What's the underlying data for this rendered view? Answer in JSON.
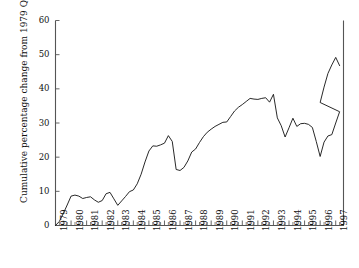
{
  "chart_data": {
    "type": "line",
    "title": "",
    "subtitle": "",
    "xlabel": "",
    "ylabel": "Cumulative percentage change from 1979 Q1",
    "ylim": [
      0,
      60
    ],
    "yticks": [
      0,
      10,
      20,
      30,
      40,
      50,
      60
    ],
    "ytick_labels": [
      "0",
      "10",
      "20",
      "30",
      "40",
      "50",
      "60"
    ],
    "xlim": [
      1979.0,
      1997.5
    ],
    "xticks": [
      1979,
      1980,
      1981,
      1982,
      1983,
      1984,
      1985,
      1986,
      1987,
      1988,
      1989,
      1990,
      1991,
      1992,
      1993,
      1994,
      1995,
      1996,
      1997
    ],
    "xtick_labels": [
      "1979",
      "1980",
      "1981",
      "1982",
      "1983",
      "1984",
      "1985",
      "1986",
      "1987",
      "1988",
      "1989",
      "1990",
      "1991",
      "1992",
      "1993",
      "1994",
      "1995",
      "1996",
      "1997"
    ],
    "minor_ticks": "quarterly",
    "grid": false,
    "legend": "none",
    "line_color": "#111111",
    "axis_color": "#555555",
    "frequency": "quarterly",
    "series": [
      {
        "name": "Cumulative percentage change from 1979 Q1",
        "x": [
          1979.0,
          1979.25,
          1979.5,
          1979.75,
          1980.0,
          1980.25,
          1980.5,
          1980.75,
          1981.0,
          1981.25,
          1981.5,
          1981.75,
          1982.0,
          1982.25,
          1982.5,
          1982.75,
          1983.0,
          1983.25,
          1983.5,
          1983.75,
          1984.0,
          1984.25,
          1984.5,
          1984.75,
          1985.0,
          1985.25,
          1985.5,
          1985.75,
          1986.0,
          1986.25,
          1986.5,
          1986.75,
          1987.0,
          1987.25,
          1987.5,
          1987.75,
          1988.0,
          1988.25,
          1988.5,
          1988.75,
          1989.0,
          1989.25,
          1989.5,
          1989.75,
          1990.0,
          1990.25,
          1990.5,
          1990.75,
          1991.0,
          1991.25,
          1991.5,
          1991.75,
          1992.0,
          1992.25,
          1992.5,
          1992.75,
          1993.0,
          1993.25,
          1993.5,
          1993.75,
          1994.0,
          1994.25,
          1994.5,
          1994.75,
          1995.0,
          1995.25,
          1995.5,
          1995.75,
          1996.0,
          1996.25,
          1996.5,
          1996.75,
          1997.0,
          1997.25
        ],
        "values": [
          0.0,
          1.2,
          3.5,
          6.0,
          8.6,
          8.9,
          8.6,
          7.9,
          8.2,
          8.4,
          7.5,
          6.8,
          7.3,
          9.3,
          9.7,
          7.8,
          5.9,
          7.2,
          8.5,
          9.9,
          10.4,
          12.2,
          15.0,
          18.6,
          21.8,
          23.3,
          23.2,
          23.6,
          24.1,
          26.3,
          24.6,
          16.4,
          16.1,
          17.0,
          18.9,
          21.5,
          22.4,
          24.3,
          26.0,
          27.3,
          28.2,
          29.0,
          29.6,
          30.2,
          30.3,
          31.9,
          33.5,
          34.6,
          35.4,
          36.3,
          37.2,
          37.0,
          36.9,
          37.2,
          37.4,
          36.1,
          38.4,
          31.5,
          29.2,
          25.9,
          28.6,
          31.4,
          29.0,
          29.8,
          29.9,
          29.6,
          28.7,
          24.6,
          20.2,
          24.4,
          26.2,
          26.6,
          30.0,
          33.3
        ]
      }
    ],
    "annotations": [
      {
        "label": "local peak 1985 Q2",
        "x": 1985.25,
        "y": 26.3
      },
      {
        "label": "sharp drop 1985 Q4",
        "x": 1985.75,
        "y": 16.4
      },
      {
        "label": "peak 1992 Q3",
        "x": 1992.5,
        "y": 38.4
      },
      {
        "label": "trough 1994 Q4",
        "x": 1994.75,
        "y": 20.2
      },
      {
        "label": "peak 1997 Q1",
        "x": 1997.0,
        "y": 49.2
      },
      {
        "label": "final 1997 Q2",
        "x": 1997.25,
        "y": 46.8
      }
    ],
    "tail_values": [
      36.0,
      40.5,
      44.5,
      47.0,
      49.2,
      46.8
    ]
  }
}
